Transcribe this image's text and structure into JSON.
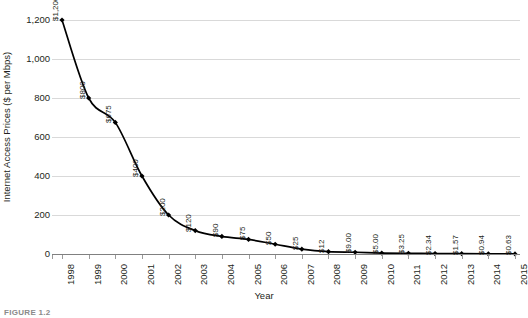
{
  "chart_data": {
    "type": "line",
    "title": "",
    "xlabel": "Year",
    "ylabel": "Internet Access Prices ($ per Mbps)",
    "categories": [
      "1998",
      "1999",
      "2000",
      "2001",
      "2002",
      "2003",
      "2004",
      "2005",
      "2006",
      "2007",
      "2008",
      "2009",
      "2010",
      "2011",
      "2012",
      "2013",
      "2014",
      "2015"
    ],
    "values": [
      1200,
      800,
      675,
      400,
      200,
      120,
      90,
      75,
      50,
      25,
      12,
      9.0,
      5.0,
      3.25,
      2.34,
      1.57,
      0.94,
      0.63
    ],
    "point_labels": [
      "$1,200",
      "$800",
      "$675",
      "$400",
      "$200",
      "$120",
      "$90",
      "$75",
      "$50",
      "$25",
      "$12",
      "$9.00",
      "$5.00",
      "$3.25",
      "$2.34",
      "$1.57",
      "$0.94",
      "$0.63"
    ],
    "ylim": [
      0,
      1200
    ],
    "ytick_labels": [
      "1,200",
      "1,000",
      "800",
      "600",
      "400",
      "200",
      "0"
    ],
    "ytick_values": [
      1200,
      1000,
      800,
      600,
      400,
      200,
      0
    ],
    "grid": true,
    "legend": false,
    "series_color": "#000000",
    "grid_color": "#d9d9d9",
    "axis_color": "#808080",
    "marker": "diamond"
  },
  "figure": {
    "caption": "FIGURE 1.2"
  }
}
